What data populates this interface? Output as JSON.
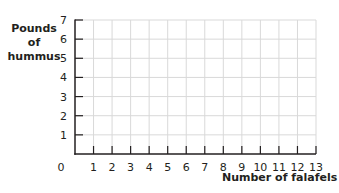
{
  "chart_data": {
    "type": "line",
    "title": "",
    "xlabel": "Number of falafels",
    "ylabel_lines": [
      "Pounds",
      "of",
      "hummus"
    ],
    "ylabel": "Pounds of hummus",
    "x_ticks": [
      "0",
      "1",
      "2",
      "3",
      "4",
      "5",
      "6",
      "7",
      "8",
      "9",
      "10",
      "11",
      "12",
      "13"
    ],
    "y_ticks": [
      "1",
      "2",
      "3",
      "4",
      "5",
      "6",
      "7"
    ],
    "xlim": [
      0,
      13
    ],
    "ylim": [
      0,
      7
    ],
    "grid": true,
    "series": []
  },
  "colors": {
    "axis": "#231f20",
    "grid": "#d9d9d9"
  }
}
